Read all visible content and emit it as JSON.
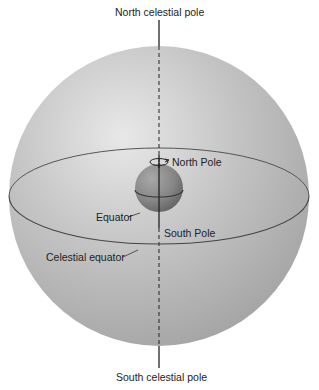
{
  "diagram": {
    "labels": {
      "north_celestial_pole": "North celestial pole",
      "south_celestial_pole": "South celestial pole",
      "north_pole": "North Pole",
      "south_pole": "South Pole",
      "equator": "Equator",
      "celestial_equator": "Celestial equator"
    },
    "colors": {
      "celestial_sphere": "#b4b4b4",
      "sphere_highlight": "#e6e6e6",
      "earth": "#8c8c8c",
      "lines": "#333333",
      "background": "#ffffff"
    }
  }
}
